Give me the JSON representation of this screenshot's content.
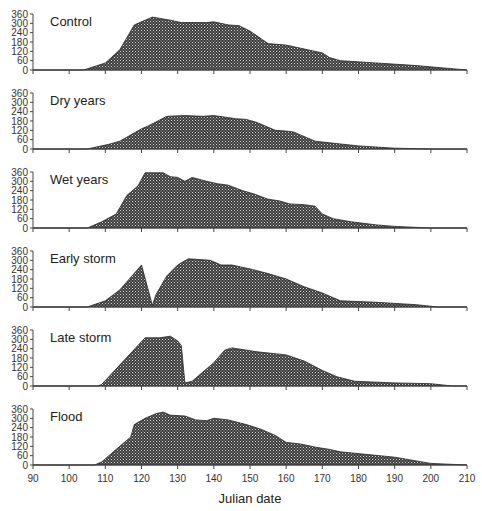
{
  "chart_data": {
    "type": "area",
    "title": "",
    "xlabel": "Julian date",
    "ylabel": "",
    "xlim": [
      90,
      210
    ],
    "ylim": [
      0,
      360
    ],
    "x_ticks": [
      90,
      100,
      110,
      120,
      130,
      140,
      150,
      160,
      170,
      180,
      190,
      200,
      210
    ],
    "y_ticks": [
      0,
      60,
      120,
      180,
      240,
      300,
      360
    ],
    "grid": false,
    "fill": "dark stippled pattern",
    "panels": [
      {
        "name": "Control",
        "x": [
          90,
          104,
          110,
          114,
          118,
          123,
          128,
          131,
          138,
          140,
          144,
          147,
          150,
          155,
          160,
          165,
          170,
          172,
          175,
          185,
          195,
          205,
          210
        ],
        "y": [
          0,
          0,
          45,
          130,
          290,
          340,
          320,
          305,
          305,
          310,
          290,
          285,
          250,
          170,
          160,
          135,
          110,
          80,
          60,
          45,
          30,
          10,
          0
        ]
      },
      {
        "name": "Dry years",
        "x": [
          90,
          105,
          111,
          114,
          120,
          122,
          127,
          132,
          137,
          140,
          143,
          146,
          149,
          152,
          157,
          160,
          162,
          168,
          172,
          180,
          190,
          200,
          210
        ],
        "y": [
          0,
          0,
          30,
          50,
          130,
          150,
          210,
          215,
          210,
          215,
          205,
          195,
          190,
          170,
          120,
          115,
          110,
          50,
          40,
          20,
          5,
          0,
          0
        ]
      },
      {
        "name": "Wet years",
        "x": [
          90,
          105,
          109,
          113,
          116,
          119,
          121,
          126,
          128,
          130,
          132,
          134,
          138,
          141,
          144,
          148,
          151,
          155,
          158,
          161,
          165,
          168,
          170,
          173,
          178,
          185,
          190,
          200,
          210
        ],
        "y": [
          0,
          0,
          40,
          90,
          210,
          270,
          355,
          355,
          330,
          325,
          300,
          325,
          300,
          285,
          275,
          240,
          220,
          185,
          175,
          155,
          150,
          140,
          90,
          60,
          40,
          20,
          10,
          0,
          0
        ]
      },
      {
        "name": "Early storm",
        "x": [
          90,
          105,
          110,
          114,
          120,
          123,
          124,
          127,
          130,
          131,
          133,
          139,
          142,
          145,
          150,
          155,
          160,
          165,
          170,
          175,
          185,
          196,
          202,
          210
        ],
        "y": [
          0,
          0,
          40,
          110,
          270,
          10,
          80,
          200,
          270,
          285,
          310,
          300,
          270,
          270,
          245,
          215,
          180,
          130,
          90,
          40,
          30,
          15,
          0,
          0
        ]
      },
      {
        "name": "Late storm",
        "x": [
          90,
          108,
          109,
          121,
          125,
          128,
          130,
          131,
          132,
          134,
          140,
          143,
          145,
          152,
          160,
          165,
          170,
          174,
          179,
          190,
          200,
          206,
          210
        ],
        "y": [
          0,
          0,
          10,
          310,
          310,
          320,
          290,
          260,
          20,
          30,
          150,
          230,
          245,
          220,
          200,
          160,
          100,
          60,
          30,
          20,
          15,
          0,
          0
        ]
      },
      {
        "name": "Flood",
        "x": [
          90,
          107,
          109,
          114,
          117,
          118,
          121,
          124,
          126,
          128,
          132,
          135,
          138,
          140,
          144,
          149,
          153,
          157,
          160,
          164,
          168,
          172,
          175,
          190,
          200,
          210
        ],
        "y": [
          0,
          0,
          20,
          120,
          180,
          260,
          300,
          330,
          340,
          320,
          315,
          290,
          285,
          300,
          290,
          260,
          230,
          190,
          145,
          135,
          115,
          100,
          85,
          50,
          10,
          0
        ]
      }
    ]
  },
  "labels": {
    "xlabel": "Julian date",
    "panel_titles": [
      "Control",
      "Dry years",
      "Wet years",
      "Early storm",
      "Late storm",
      "Flood"
    ]
  }
}
